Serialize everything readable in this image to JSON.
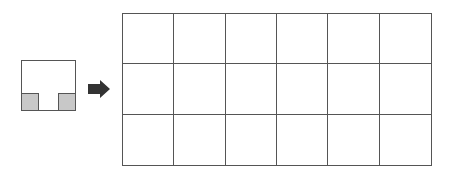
{
  "diagram": {
    "piece": {
      "shape": "square",
      "notches": [
        "bottom-left",
        "bottom-right"
      ],
      "notch_color": "#c8c8c8",
      "outline_color": "#555555"
    },
    "arrow": {
      "direction": "right",
      "color": "#333333"
    },
    "grid": {
      "columns": 6,
      "rows": 3,
      "line_color": "#555555",
      "fill": "#ffffff"
    }
  }
}
